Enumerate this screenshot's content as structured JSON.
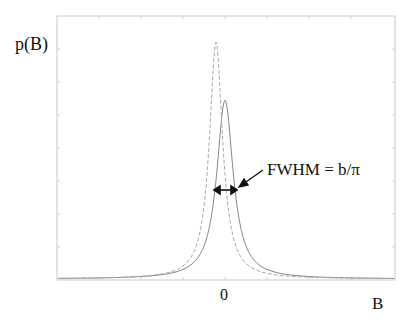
{
  "chart_data": {
    "type": "line",
    "title": "",
    "ylabel": "p(B)",
    "xlabel": "B",
    "x_tick_labels": [
      "0"
    ],
    "grid": false,
    "legend": null,
    "series": [
      {
        "name": "Lorentzian (solid)",
        "style": "solid",
        "peak_x": 0,
        "peak_height_rel": 0.68
      },
      {
        "name": "Comparison distribution (dashed)",
        "style": "dashed",
        "peak_x": -0.03,
        "peak_height_rel": 0.9
      }
    ],
    "annotations": [
      {
        "text": "FWHM = b/π",
        "type": "arrow",
        "target": "full width at half maximum of solid curve"
      }
    ]
  },
  "labels": {
    "ylabel": "p(B)",
    "xlabel": "B",
    "xtick0": "0",
    "annotation": "FWHM = b/π"
  },
  "colors": {
    "axis": "#c8c8c8",
    "solid": "#888888",
    "dashed": "#aaaaaa",
    "annotation": "#111111"
  }
}
